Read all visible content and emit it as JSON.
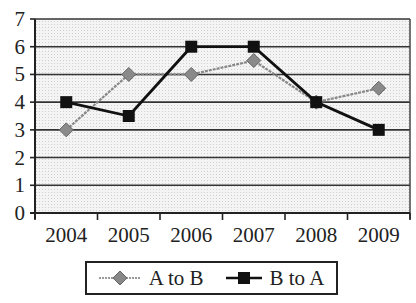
{
  "chart_data": {
    "type": "line",
    "title": "",
    "xlabel": "",
    "ylabel": "",
    "categories": [
      "2004",
      "2005",
      "2006",
      "2007",
      "2008",
      "2009"
    ],
    "series": [
      {
        "name": "A to B",
        "values": [
          3,
          5,
          5,
          5.5,
          4,
          4.5
        ],
        "color": "#888888",
        "marker": "diamond"
      },
      {
        "name": "B to A",
        "values": [
          4,
          3.5,
          6,
          6,
          4,
          3
        ],
        "color": "#111111",
        "marker": "square"
      }
    ],
    "ylim": [
      0,
      7
    ],
    "yticks": [
      0,
      1,
      2,
      3,
      4,
      5,
      6,
      7
    ],
    "grid": true,
    "legend_position": "bottom"
  },
  "legend": {
    "items": [
      {
        "label": "A to B"
      },
      {
        "label": "B to A"
      }
    ]
  }
}
